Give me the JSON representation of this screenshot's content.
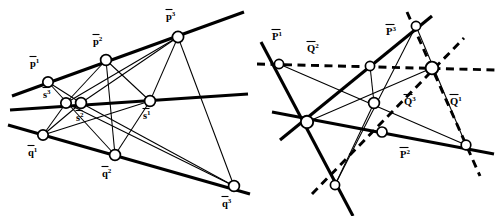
{
  "figure": {
    "title": "",
    "background_color": "#ffffff",
    "stroke_color": "#000000",
    "width": 504,
    "height": 216,
    "panels": [
      {
        "id": "left",
        "name": "left-diagram",
        "points": [
          {
            "id": "p1",
            "label_base": "p",
            "label_sup": "1",
            "overbar": true,
            "bold": true,
            "x": 48,
            "y": 82,
            "r": 5.2,
            "label_x": 30,
            "label_y": 67
          },
          {
            "id": "p2",
            "label_base": "p",
            "label_sup": "2",
            "overbar": true,
            "bold": true,
            "x": 106,
            "y": 60,
            "r": 5.4,
            "label_x": 93,
            "label_y": 45
          },
          {
            "id": "p3",
            "label_base": "p",
            "label_sup": "3",
            "overbar": true,
            "bold": true,
            "x": 178,
            "y": 37,
            "r": 5.6,
            "label_x": 166,
            "label_y": 20
          },
          {
            "id": "s3",
            "label_base": "s",
            "label_sup": "3",
            "overbar": true,
            "bold": true,
            "x": 66,
            "y": 103,
            "r": 5.2,
            "label_x": 43,
            "label_y": 98
          },
          {
            "id": "s2",
            "label_base": "s",
            "label_sup": "2",
            "overbar": true,
            "bold": true,
            "x": 81,
            "y": 103,
            "r": 5.4,
            "label_x": 76,
            "label_y": 121
          },
          {
            "id": "s1",
            "label_base": "s",
            "label_sup": "1",
            "overbar": true,
            "bold": true,
            "x": 150,
            "y": 101,
            "r": 5.4,
            "label_x": 143,
            "label_y": 119
          },
          {
            "id": "q1",
            "label_base": "q",
            "label_sup": "1",
            "overbar": true,
            "bold": true,
            "x": 43,
            "y": 135,
            "r": 5.2,
            "label_x": 28,
            "label_y": 156
          },
          {
            "id": "q2",
            "label_base": "q",
            "label_sup": "2",
            "overbar": true,
            "bold": true,
            "x": 115,
            "y": 155,
            "r": 5.4,
            "label_x": 102,
            "label_y": 177
          },
          {
            "id": "q3",
            "label_base": "q",
            "label_sup": "3",
            "overbar": true,
            "bold": true,
            "x": 234,
            "y": 186,
            "r": 5.4,
            "label_x": 222,
            "label_y": 207
          }
        ],
        "thick_lines": [
          {
            "name": "line-p",
            "x1": 12,
            "y1": 96,
            "x2": 244,
            "y2": 12
          },
          {
            "name": "line-s",
            "x1": 10,
            "y1": 110,
            "x2": 248,
            "y2": 94
          },
          {
            "name": "line-q",
            "x1": 8,
            "y1": 125,
            "x2": 250,
            "y2": 194
          }
        ],
        "thin_lines": [
          {
            "name": "p1-s2",
            "x1": 48,
            "y1": 82,
            "x2": 81,
            "y2": 103
          },
          {
            "name": "p1-q2",
            "x1": 48,
            "y1": 82,
            "x2": 115,
            "y2": 155
          },
          {
            "name": "p2-s3",
            "x1": 106,
            "y1": 60,
            "x2": 66,
            "y2": 103
          },
          {
            "name": "p2-s1",
            "x1": 106,
            "y1": 60,
            "x2": 150,
            "y2": 101
          },
          {
            "name": "p2-q2",
            "x1": 106,
            "y1": 60,
            "x2": 115,
            "y2": 155
          },
          {
            "name": "p3-s3",
            "x1": 178,
            "y1": 37,
            "x2": 66,
            "y2": 103
          },
          {
            "name": "p3-s2",
            "x1": 178,
            "y1": 37,
            "x2": 81,
            "y2": 103
          },
          {
            "name": "p3-s1",
            "x1": 178,
            "y1": 37,
            "x2": 150,
            "y2": 101
          },
          {
            "name": "p3-q3",
            "x1": 178,
            "y1": 37,
            "x2": 234,
            "y2": 186
          },
          {
            "name": "s3-q1",
            "x1": 66,
            "y1": 103,
            "x2": 43,
            "y2": 135
          },
          {
            "name": "s2-q1",
            "x1": 81,
            "y1": 103,
            "x2": 43,
            "y2": 135
          },
          {
            "name": "s3-q3",
            "x1": 66,
            "y1": 103,
            "x2": 234,
            "y2": 186
          },
          {
            "name": "s2-q3",
            "x1": 81,
            "y1": 103,
            "x2": 234,
            "y2": 186
          },
          {
            "name": "s1-q2",
            "x1": 150,
            "y1": 101,
            "x2": 115,
            "y2": 155
          },
          {
            "name": "q1-s1",
            "x1": 43,
            "y1": 135,
            "x2": 150,
            "y2": 101
          }
        ]
      },
      {
        "id": "right",
        "name": "right-diagram",
        "points": [
          {
            "id": "P1",
            "label_base": "P",
            "label_sup": "1",
            "overbar": true,
            "bold": true,
            "x": 27,
            "y": 64,
            "r": 4.6,
            "label_x": 20,
            "label_y": 40
          },
          {
            "id": "Q2",
            "label_base": "Q",
            "label_sup": "2",
            "overbar": true,
            "bold": true,
            "x": -1,
            "y": -1,
            "r": 0,
            "label_x": 55,
            "label_y": 52
          },
          {
            "id": "P3",
            "label_base": "P",
            "label_sup": "3",
            "overbar": true,
            "bold": true,
            "x": 164,
            "y": 26,
            "r": 4.6,
            "label_x": 134,
            "label_y": 35
          },
          {
            "id": "node-left",
            "label_base": "",
            "label_sup": "",
            "overbar": false,
            "bold": false,
            "x": 55,
            "y": 122,
            "r": 6.2,
            "label_x": 0,
            "label_y": 0
          },
          {
            "id": "node-mid",
            "label_base": "",
            "label_sup": "",
            "overbar": false,
            "bold": false,
            "x": 122,
            "y": 103,
            "r": 5.4,
            "label_x": 0,
            "label_y": 0
          },
          {
            "id": "node-upper",
            "label_base": "",
            "label_sup": "",
            "overbar": false,
            "bold": false,
            "x": 118,
            "y": 66,
            "r": 4.6,
            "label_x": 0,
            "label_y": 0
          },
          {
            "id": "node-hub",
            "label_base": "",
            "label_sup": "",
            "overbar": false,
            "bold": false,
            "x": 180,
            "y": 68,
            "r": 6.4,
            "label_x": 0,
            "label_y": 0
          },
          {
            "id": "node-lower",
            "label_base": "",
            "label_sup": "",
            "overbar": false,
            "bold": false,
            "x": 130,
            "y": 132,
            "r": 5.0,
            "label_x": 0,
            "label_y": 0
          },
          {
            "id": "node-bottom",
            "label_base": "",
            "label_sup": "",
            "overbar": false,
            "bold": false,
            "x": 83,
            "y": 185,
            "r": 4.6,
            "label_x": 0,
            "label_y": 0
          },
          {
            "id": "node-right",
            "label_base": "",
            "label_sup": "",
            "overbar": false,
            "bold": false,
            "x": 214,
            "y": 145,
            "r": 4.8,
            "label_x": 0,
            "label_y": 0
          },
          {
            "id": "Q3",
            "label_base": "Q",
            "label_sup": "3",
            "overbar": true,
            "bold": true,
            "x": -1,
            "y": -1,
            "r": 0,
            "label_x": 152,
            "label_y": 105
          },
          {
            "id": "Q1",
            "label_base": "Q",
            "label_sup": "1",
            "overbar": true,
            "bold": true,
            "x": -1,
            "y": -1,
            "r": 0,
            "label_x": 198,
            "label_y": 105
          },
          {
            "id": "P2",
            "label_base": "P",
            "label_sup": "2",
            "overbar": true,
            "bold": true,
            "x": -1,
            "y": -1,
            "r": 0,
            "label_x": 148,
            "label_y": 158
          }
        ],
        "thick_lines": [
          {
            "name": "line-P1",
            "x1": 9,
            "y1": 42,
            "x2": 101,
            "y2": 216
          },
          {
            "name": "line-P3",
            "x1": 28,
            "y1": 140,
            "x2": 180,
            "y2": 16
          },
          {
            "name": "line-P2",
            "x1": 20,
            "y1": 112,
            "x2": 242,
            "y2": 154
          }
        ],
        "dashed_lines": [
          {
            "name": "line-Q2",
            "x1": 5,
            "y1": 64,
            "x2": 244,
            "y2": 70
          },
          {
            "name": "line-Q1",
            "x1": 155,
            "y1": 12,
            "x2": 228,
            "y2": 176
          },
          {
            "name": "line-Q3",
            "x1": 60,
            "y1": 194,
            "x2": 212,
            "y2": 38
          }
        ],
        "thin_lines": [
          {
            "name": "P1-right",
            "x1": 27,
            "y1": 64,
            "x2": 214,
            "y2": 145
          },
          {
            "name": "P3-bottom",
            "x1": 164,
            "y1": 26,
            "x2": 83,
            "y2": 185
          },
          {
            "name": "P3-right",
            "x1": 164,
            "y1": 26,
            "x2": 214,
            "y2": 145
          },
          {
            "name": "upper-mid",
            "x1": 118,
            "y1": 66,
            "x2": 122,
            "y2": 103
          },
          {
            "name": "mid-bottom",
            "x1": 122,
            "y1": 103,
            "x2": 83,
            "y2": 185
          },
          {
            "name": "hub-left",
            "x1": 180,
            "y1": 68,
            "x2": 55,
            "y2": 122
          }
        ]
      }
    ]
  }
}
